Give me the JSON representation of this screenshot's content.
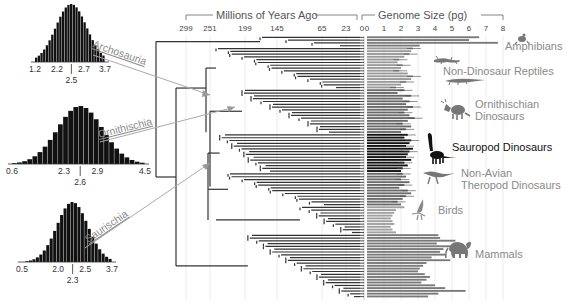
{
  "chart_data": {
    "type": "bar",
    "title": "",
    "layout": {
      "left": "three posterior histograms of ancestral genome size",
      "center": "time-calibrated phylogeny",
      "right": "horizontal bars of genome size per tip with error whiskers",
      "grid": true
    },
    "time_axis": {
      "label": "Millions of Years Ago",
      "ticks": [
        299,
        251,
        199,
        145,
        65,
        23,
        0
      ]
    },
    "genome_axis": {
      "label": "Genome Size (pg)",
      "ticks": [
        0,
        1,
        2,
        3,
        4,
        5,
        6,
        7,
        8
      ],
      "xlim": [
        0,
        8
      ]
    },
    "histograms": [
      {
        "clade": "Archosauria",
        "ticks": [
          "1.2",
          "2.2",
          "2.7",
          "3.7"
        ],
        "median": "2.5",
        "min": 1.2,
        "max": 3.7,
        "ci": [
          2.2,
          2.7
        ],
        "mean": 2.5
      },
      {
        "clade": "Ornithischia",
        "ticks": [
          "0.6",
          "2.3",
          "2.9",
          "4.5"
        ],
        "median": "2.6",
        "min": 0.6,
        "max": 4.5,
        "ci": [
          2.3,
          2.9
        ],
        "mean": 2.6
      },
      {
        "clade": "Saurischia",
        "ticks": [
          "0.5",
          "2.0",
          "2.5",
          "3.7"
        ],
        "median": "2.3",
        "min": 0.5,
        "max": 3.7,
        "ci": [
          2.0,
          2.5
        ],
        "mean": 2.3
      }
    ],
    "groups": [
      {
        "name": "Amphibians",
        "color": "#7a7a7a",
        "label_color": "#8a8a8a",
        "values": [
          6.6,
          6.0,
          7.7,
          3.1
        ]
      },
      {
        "name": "Non-Dinosaur Reptiles",
        "color": "#9a9a9a",
        "label_color": "#8a8a8a",
        "values": [
          2.7,
          2.6,
          2.5,
          2.2,
          1.9,
          1.8,
          2.1,
          2.0,
          1.9,
          2.4,
          2.7,
          2.6,
          2.3,
          2.0,
          1.7
        ]
      },
      {
        "name": "Ornithischian Dinosaurs",
        "color": "#6a6a6a",
        "label_color": "#8a8a8a",
        "values": [
          2.2,
          1.8,
          2.6,
          2.1,
          2.5,
          2.3,
          2.7,
          2.4,
          2.2,
          2.5,
          2.8,
          2.4,
          2.1,
          2.6,
          2.3,
          2.0
        ]
      },
      {
        "name": "Sauropod Dinosaurs",
        "color": "#111111",
        "label_color": "#111111",
        "values": [
          2.4,
          2.2,
          2.6,
          2.5,
          2.3,
          2.7,
          2.5,
          2.4,
          2.3,
          2.6,
          2.2,
          2.4,
          2.1,
          2.0
        ]
      },
      {
        "name": "Non-Avian Theropod Dinosaurs",
        "color": "#6a6a6a",
        "label_color": "#8a8a8a",
        "values": [
          2.1,
          2.3,
          2.0,
          2.5,
          2.2,
          1.9,
          2.4,
          2.6,
          2.3,
          2.1,
          1.8,
          2.0
        ]
      },
      {
        "name": "Birds",
        "color": "#a0a0a0",
        "label_color": "#8a8a8a",
        "values": [
          2.2,
          1.7,
          1.6,
          1.5,
          1.4,
          1.5,
          1.6,
          1.4,
          1.5,
          1.7
        ]
      },
      {
        "name": "Mammals",
        "color": "#7a7a7a",
        "label_color": "#8a8a8a",
        "values": [
          4.2,
          4.3,
          5.2,
          4.1,
          5.4,
          4.5,
          4.3,
          4.6,
          3.8,
          4.9,
          3.5,
          3.3,
          3.1,
          3.0,
          3.4,
          3.7,
          3.5,
          3.2,
          4.0,
          4.6,
          5.8,
          4.2,
          3.6
        ]
      }
    ]
  },
  "header": {
    "time_label": "Millions of Years Ago",
    "genome_label": "Genome Size (pg)"
  },
  "clade_labels": [
    "Archosauria",
    "Ornithischia",
    "Saurischia"
  ],
  "group_labels": {
    "amphibians": "Amphibians",
    "reptiles": "Non-Dinosaur Reptiles",
    "ornithischian_1": "Ornithischian",
    "ornithischian_2": "Dinosaurs",
    "sauropod": "Sauropod Dinosaurs",
    "theropod_1": "Non-Avian",
    "theropod_2": "Theropod Dinosaurs",
    "birds": "Birds",
    "mammals": "Mammals"
  }
}
